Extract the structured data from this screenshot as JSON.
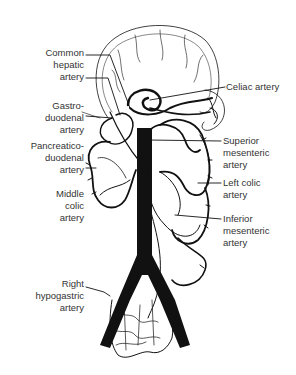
{
  "figure": {
    "style": "black-and-white line drawing",
    "colors": {
      "ink": "#111111",
      "label_text": "#333333",
      "background": "#ffffff"
    }
  },
  "labels_left": [
    {
      "id": "common-hepatic-artery",
      "lines": [
        "Common",
        "hepatic",
        "artery"
      ]
    },
    {
      "id": "gastroduodenal-artery",
      "lines": [
        "Gastro-",
        "duodenal",
        "artery"
      ]
    },
    {
      "id": "pancreaticoduodenal-artery",
      "lines": [
        "Pancreatico-",
        "duodenal",
        "artery"
      ]
    },
    {
      "id": "middle-colic-artery",
      "lines": [
        "Middle",
        "colic",
        "artery"
      ]
    },
    {
      "id": "right-hypogastric-artery",
      "lines": [
        "Right",
        "hypogastric",
        "artery"
      ]
    }
  ],
  "labels_right": [
    {
      "id": "celiac-artery",
      "lines": [
        "Celiac artery"
      ]
    },
    {
      "id": "superior-mesenteric-artery",
      "lines": [
        "Superior",
        "mesenteric",
        "artery"
      ]
    },
    {
      "id": "left-colic-artery",
      "lines": [
        "Left colic",
        "artery"
      ]
    },
    {
      "id": "inferior-mesenteric-artery",
      "lines": [
        "Inferior",
        "mesenteric",
        "artery"
      ]
    }
  ]
}
